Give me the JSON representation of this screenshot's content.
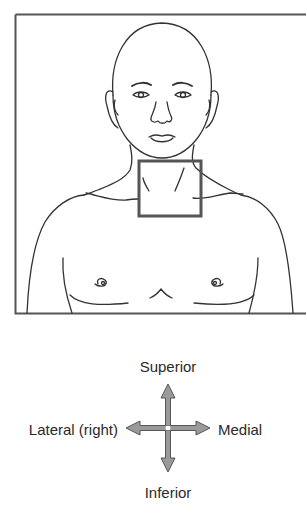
{
  "figure": {
    "highlight_region": "anterior neck",
    "frame_color": "#555555",
    "line_color": "#333333",
    "highlight_color": "#555555"
  },
  "compass": {
    "superior": "Superior",
    "inferior": "Inferior",
    "lateral": "Lateral (right)",
    "medial": "Medial",
    "arrow_color": "#888888"
  }
}
